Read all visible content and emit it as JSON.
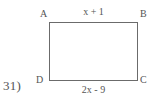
{
  "problem": {
    "number_label": "31)"
  },
  "figure": {
    "shape": "rectangle",
    "vertices": [
      {
        "name": "A",
        "label": "A",
        "position": "top-left"
      },
      {
        "name": "B",
        "label": "B",
        "position": "top-right"
      },
      {
        "name": "C",
        "label": "C",
        "position": "bottom-right"
      },
      {
        "name": "D",
        "label": "D",
        "position": "bottom-left"
      }
    ],
    "side_labels": {
      "top": "x + 1",
      "bottom": "2x - 9"
    },
    "colors": {
      "stroke": "#6b6b6b",
      "text": "#555555",
      "background": "#ffffff"
    }
  }
}
